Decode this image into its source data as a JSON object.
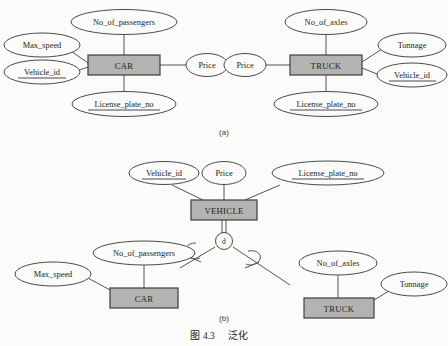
{
  "figure": {
    "caption_label": "图",
    "caption_number": "4.3",
    "caption_title": "泛化",
    "panel_a_label": "(a)",
    "panel_b_label": "(b)"
  },
  "style": {
    "page_bg": "#fbfbf9",
    "entity_fill": "#b3b3b1",
    "entity_stroke": "#3d3d3b",
    "ellipse_fill": "#fbfbf9",
    "ellipse_stroke": "#4a4a48",
    "line_color": "#55544f",
    "text_color": "#231f20"
  },
  "panel_a": {
    "entities": [
      {
        "name": "car-entity",
        "label": "CAR"
      },
      {
        "name": "truck-entity",
        "label": "TRUCK"
      }
    ],
    "car_attributes": [
      {
        "name": "attr-no-of-passengers",
        "label": "No_of_passengers",
        "key": false
      },
      {
        "name": "attr-max-speed",
        "label": "Max_speed",
        "key": false
      },
      {
        "name": "attr-vehicle-id",
        "label": "Vehicle_id",
        "key": true
      },
      {
        "name": "attr-license-plate-no",
        "label": "License_plate_no",
        "key": true
      },
      {
        "name": "attr-price",
        "label": "Price",
        "key": false
      }
    ],
    "truck_attributes": [
      {
        "name": "attr-no-of-axles",
        "label": "No_of_axles",
        "key": false
      },
      {
        "name": "attr-price",
        "label": "Price",
        "key": false
      },
      {
        "name": "attr-tonnage",
        "label": "Tonnage",
        "key": false
      },
      {
        "name": "attr-vehicle-id",
        "label": "Vehicle_id",
        "key": true
      },
      {
        "name": "attr-license-plate-no",
        "label": "License_plate_no",
        "key": true
      }
    ]
  },
  "panel_b": {
    "superclass": {
      "name": "vehicle-entity",
      "label": "VEHICLE"
    },
    "superclass_attributes": [
      {
        "name": "attr-vehicle-id",
        "label": "Vehicle_id",
        "key": true
      },
      {
        "name": "attr-price",
        "label": "Price",
        "key": false
      },
      {
        "name": "attr-license-plate-no",
        "label": "License_plate_no",
        "key": true
      }
    ],
    "specialization": {
      "name": "disjoint-circle",
      "label": "d",
      "type": "disjoint"
    },
    "subclasses": [
      {
        "name": "car-entity",
        "label": "CAR"
      },
      {
        "name": "truck-entity",
        "label": "TRUCK"
      }
    ],
    "car_attributes": [
      {
        "name": "attr-no-of-passengers",
        "label": "No_of_passengers",
        "key": false
      },
      {
        "name": "attr-max-speed",
        "label": "Max_speed",
        "key": false
      }
    ],
    "truck_attributes": [
      {
        "name": "attr-no-of-axles",
        "label": "No_of_axles",
        "key": false
      },
      {
        "name": "attr-tonnage",
        "label": "Tonnage",
        "key": false
      }
    ]
  }
}
